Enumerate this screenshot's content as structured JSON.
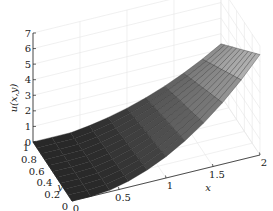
{
  "chart_data": {
    "type": "surface3d",
    "title": "",
    "xlabel": "x",
    "ylabel": "y",
    "zlabel": "u(x,y)",
    "xlim": [
      0,
      2
    ],
    "ylim": [
      0,
      1
    ],
    "zlim": [
      0,
      7
    ],
    "x_ticks": [
      "0",
      "0.5",
      "1",
      "1.5",
      "2"
    ],
    "y_ticks": [
      "0",
      "0.2",
      "0.4",
      "0.6",
      "0.8",
      "1"
    ],
    "z_ticks": [
      "0",
      "1",
      "2",
      "3",
      "4",
      "5",
      "6",
      "7"
    ],
    "grid": true,
    "colormap": "gray",
    "mesh": {
      "nx": 11,
      "ny": 11
    },
    "sample_values": [
      {
        "x": 0,
        "y": 0,
        "u": 0
      },
      {
        "x": 0,
        "y": 1,
        "u": 0
      },
      {
        "x": 1,
        "y": 0,
        "u": 1.8
      },
      {
        "x": 1,
        "y": 1,
        "u": 0.9
      },
      {
        "x": 2,
        "y": 0,
        "u": 6.5
      },
      {
        "x": 2,
        "y": 0.5,
        "u": 5.0
      },
      {
        "x": 2,
        "y": 1,
        "u": 3.2
      }
    ]
  }
}
